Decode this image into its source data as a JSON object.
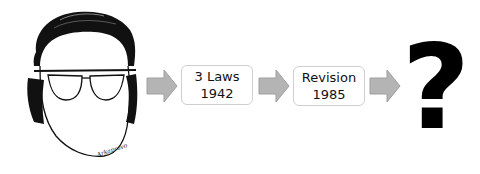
{
  "diagram": {
    "portrait": {
      "subject": "caricature-face-with-glasses",
      "signature": "Arkapravo"
    },
    "steps": [
      {
        "line1": "3 Laws",
        "line2": "1942"
      },
      {
        "line1": "Revision",
        "line2": "1985"
      }
    ],
    "final": {
      "label": "?"
    },
    "colors": {
      "arrow_fill": "#b4b4b4",
      "arrow_stroke": "#a0a0a0",
      "box_border": "#cfcfcf",
      "ink": "#000000"
    }
  }
}
